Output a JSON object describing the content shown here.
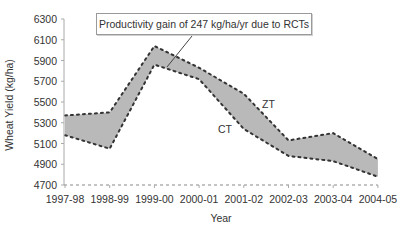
{
  "chart_data": {
    "type": "area",
    "title": "",
    "xlabel": "Year",
    "ylabel": "Wheat Yield (kg/ha)",
    "categories": [
      "1997-98",
      "1998-99",
      "1999-00",
      "2000-01",
      "2001-02",
      "2002-03",
      "2003-04",
      "2004-05"
    ],
    "series": [
      {
        "name": "ZT",
        "values": [
          5370,
          5400,
          6040,
          5830,
          5580,
          5130,
          5200,
          4950
        ]
      },
      {
        "name": "CT",
        "values": [
          5180,
          5050,
          5860,
          5720,
          5240,
          4980,
          4930,
          4780
        ]
      }
    ],
    "ylim": [
      4700,
      6300
    ],
    "yticks": [
      4700,
      4900,
      5100,
      5300,
      5500,
      5700,
      5900,
      6100,
      6300
    ],
    "grid": false,
    "legend": "none (inline labels ZT and CT)",
    "annotations": [
      {
        "text": "Productivity gain of 247 kg/ha/yr due to RCTs",
        "points_to": "band between ZT and CT near 1999-00/2000-01"
      }
    ],
    "fill_between": {
      "upper": "ZT",
      "lower": "CT",
      "color": "#b9b9b9"
    }
  },
  "labels": {
    "annotation": "Productivity gain of 247 kg/ha/yr due to RCTs",
    "zt": "ZT",
    "ct": "CT",
    "xlabel": "Year",
    "ylabel": "Wheat Yield (kg/ha)"
  },
  "colors": {
    "band_fill": "#b9b9b9",
    "line_dots": "#333333",
    "axis": "#aaaaaa",
    "text": "#333333"
  }
}
